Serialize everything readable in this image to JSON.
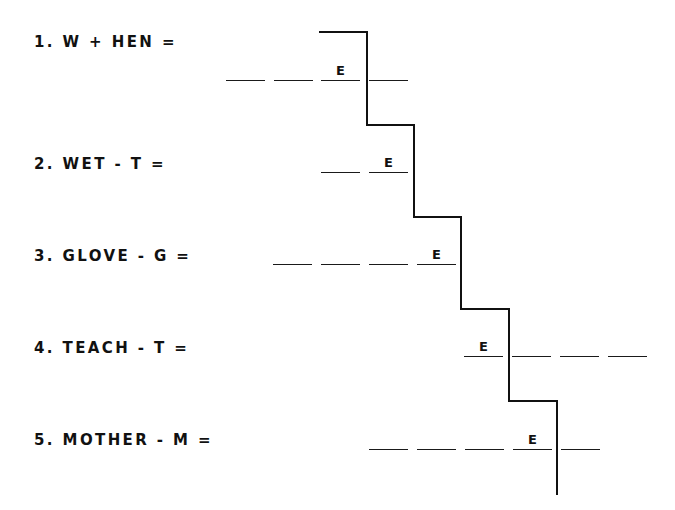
{
  "worksheet": {
    "rows": [
      {
        "label": "1. W + HEN =",
        "blanks": 4,
        "given_letter": "E",
        "given_index": 2
      },
      {
        "label": "2. WET - T =",
        "blanks": 2,
        "given_letter": "E",
        "given_index": 1
      },
      {
        "label": "3. GLOVE - G =",
        "blanks": 4,
        "given_letter": "E",
        "given_index": 3
      },
      {
        "label": "4. TEACH - T =",
        "blanks": 4,
        "given_letter": "E",
        "given_index": 0
      },
      {
        "label": "5. MOTHER - M =",
        "blanks": 5,
        "given_letter": "E",
        "given_index": 3
      }
    ]
  }
}
